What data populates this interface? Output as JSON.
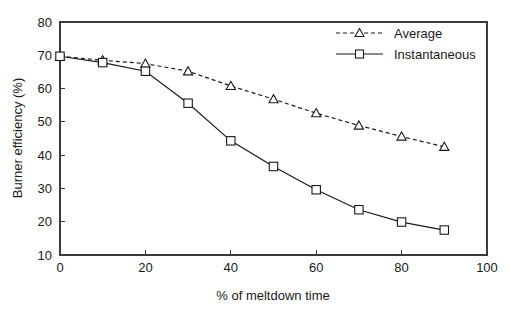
{
  "chart_data": {
    "type": "line",
    "title": "",
    "xlabel": "% of meltdown time",
    "ylabel": "Burner efficiency (%)",
    "xlim": [
      0,
      100
    ],
    "ylim": [
      10,
      80
    ],
    "xticks": [
      0,
      20,
      40,
      60,
      80,
      100
    ],
    "xtick_labels": [
      "0",
      "20",
      "40",
      "60",
      "80",
      "100"
    ],
    "yticks": [
      10,
      20,
      30,
      40,
      50,
      60,
      70,
      80
    ],
    "ytick_labels": [
      "10",
      "20",
      "30",
      "40",
      "50",
      "60",
      "70",
      "80"
    ],
    "x": [
      0,
      10,
      20,
      30,
      40,
      50,
      60,
      70,
      80,
      90
    ],
    "grid": false,
    "legend_position": "top-right",
    "series": [
      {
        "name": "Average",
        "marker": "triangle",
        "linestyle": "dashed",
        "color": "#1a1a1a",
        "values": [
          69.7,
          68.5,
          67.5,
          65.2,
          60.8,
          56.8,
          52.6,
          48.9,
          45.6,
          42.5
        ]
      },
      {
        "name": "Instantaneous",
        "marker": "square",
        "linestyle": "solid",
        "color": "#1a1a1a",
        "values": [
          69.7,
          67.8,
          65.2,
          55.6,
          44.3,
          36.6,
          29.6,
          23.6,
          19.9,
          17.5
        ]
      }
    ]
  },
  "legend": {
    "entries": [
      {
        "label": "Average"
      },
      {
        "label": "Instantaneous"
      }
    ]
  },
  "axes": {
    "x_title": "% of meltdown time",
    "y_title": "Burner efficiency (%)"
  }
}
